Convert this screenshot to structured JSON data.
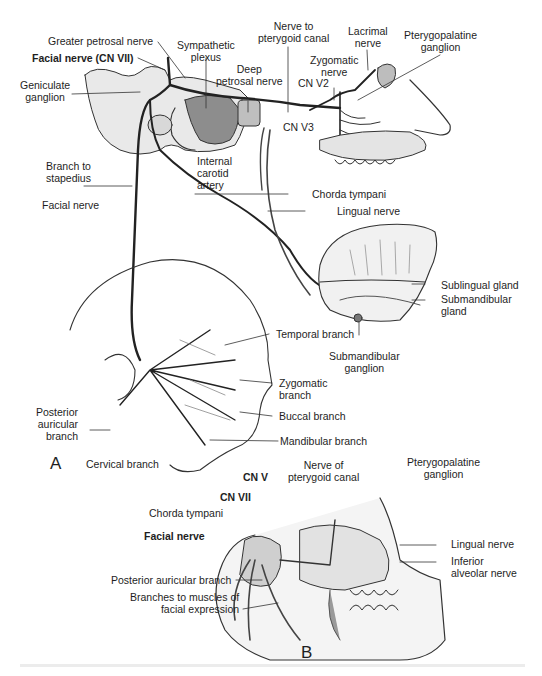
{
  "figure": {
    "panels": [
      "A",
      "B"
    ]
  },
  "panel_a": {
    "label": "A",
    "labels": {
      "greater_petrosal": "Greater petrosal nerve",
      "facial_cn7": "Facial nerve (CN VII)",
      "geniculate": "Geniculate\nganglion",
      "sympathetic": "Sympathetic\nplexus",
      "deep_petrosal": "Deep\npetrosal nerve",
      "nerve_pterygoid_canal": "Nerve to\npterygoid canal",
      "lacrimal": "Lacrimal\nnerve",
      "pterygopalatine": "Pterygopalatine\nganglion",
      "zygomatic_nerve": "Zygomatic\nnerve",
      "cn_v2": "CN V2",
      "cn_v3": "CN V3",
      "branch_stapedius": "Branch to\nstapedius",
      "internal_carotid": "Internal\ncarotid\nartery",
      "chorda_tympani": "Chorda tympani",
      "lingual_nerve": "Lingual nerve",
      "facial_nerve": "Facial nerve",
      "sublingual_gland": "Sublingual gland",
      "submandibular_gland": "Submandibular\ngland",
      "submandibular_ganglion": "Submandibular\nganglion",
      "temporal_branch": "Temporal branch",
      "zygomatic_branch": "Zygomatic\nbranch",
      "buccal_branch": "Buccal branch",
      "mandibular_branch": "Mandibular branch",
      "posterior_auricular": "Posterior\nauricular\nbranch",
      "cervical_branch": "Cervical branch"
    }
  },
  "panel_b": {
    "label": "B",
    "labels": {
      "pterygopalatine": "Pterygopalatine\nganglion",
      "nerve_pterygoid_canal": "Nerve of\npterygoid canal",
      "cn_v": "CN V",
      "cn_vii": "CN VII",
      "chorda_tympani": "Chorda tympani",
      "facial_nerve": "Facial nerve",
      "lingual_nerve": "Lingual nerve",
      "inferior_alveolar": "Inferior\nalveolar nerve",
      "posterior_auricular": "Posterior auricular branch",
      "branches_muscles": "Branches to muscles of\nfacial expression"
    }
  },
  "colors": {
    "ink": "#1e1e1e",
    "bone_fill": "#e6e6e6",
    "shade": "#9a9a9a",
    "background": "#ffffff"
  }
}
